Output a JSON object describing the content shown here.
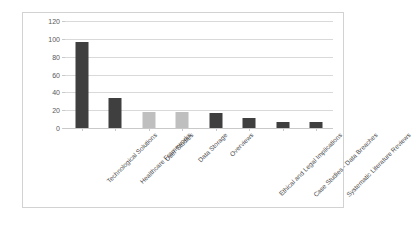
{
  "chart_data": {
    "type": "bar",
    "title": "",
    "xlabel": "",
    "ylabel": "No. of Papers",
    "ylim": [
      0,
      120
    ],
    "yticks": [
      0,
      20,
      40,
      60,
      80,
      100,
      120
    ],
    "grid": true,
    "legend": "none",
    "categories": [
      "Technological Solutions",
      "Healthcare Frameworks",
      "User Studies",
      "Data Storage",
      "Overviews",
      "Ethical and Legal Implications",
      "Case Studies - Data Breaches",
      "Systematic Literature Reviews"
    ],
    "values": [
      97,
      34,
      18,
      18,
      17,
      11,
      7,
      7
    ],
    "bar_colors": [
      "#3f3f3f",
      "#3f3f3f",
      "#bfbfbf",
      "#bfbfbf",
      "#3f3f3f",
      "#3f3f3f",
      "#3f3f3f",
      "#3f3f3f"
    ]
  },
  "style": {
    "gridline_color": "#d9d9d9",
    "frame_color": "#d2d2d2",
    "tick_label_color": "#595959",
    "axis_title_color": "#404040",
    "background": "#ffffff"
  }
}
